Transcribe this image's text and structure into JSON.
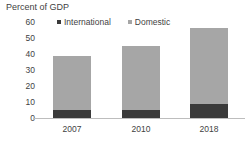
{
  "chart_data": {
    "type": "bar",
    "title": "Percent of GDP",
    "subtitle": "",
    "xlabel": "",
    "ylabel": "",
    "stacked": true,
    "grid": false,
    "legend_position": "top",
    "categories": [
      "2007",
      "2010",
      "2018"
    ],
    "ylim": [
      0,
      60
    ],
    "yticks": [
      "0",
      "10",
      "20",
      "30",
      "40",
      "50",
      "60"
    ],
    "ytick_values": [
      0,
      10,
      20,
      30,
      40,
      50,
      60
    ],
    "series": [
      {
        "name": "International",
        "color": "#3a3a3a",
        "values": [
          5,
          5,
          9
        ]
      },
      {
        "name": "Domestic",
        "color": "#a6a6a6",
        "values": [
          34,
          40,
          47
        ]
      }
    ],
    "totals": [
      39,
      45,
      56
    ]
  },
  "colors": {
    "international": "#3a3a3a",
    "domestic": "#a6a6a6",
    "axis_line": "#bdbdbd",
    "text": "#3f3f3f",
    "background": "#ffffff"
  }
}
